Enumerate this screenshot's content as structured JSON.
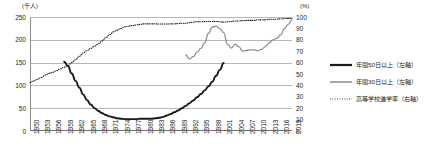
{
  "axes": {
    "left_unit": "(千人)",
    "right_unit": "(%)",
    "left_ticks": [
      "250",
      "200",
      "150",
      "100",
      "50",
      "0"
    ],
    "right_ticks": [
      "100",
      "90",
      "80",
      "70",
      "60",
      "50",
      "40",
      "30",
      "20",
      "10",
      "0"
    ],
    "x_ticks": [
      "1950",
      "1953",
      "1956",
      "1959",
      "1962",
      "1965",
      "1968",
      "1971",
      "1974",
      "1977",
      "1980",
      "1983",
      "1986",
      "1989",
      "1992",
      "1995",
      "1998",
      "2001",
      "2004",
      "2007",
      "2010",
      "2013",
      "2016",
      "2019"
    ]
  },
  "legend": {
    "items": [
      {
        "label": "年間50日以上（左軸）",
        "style": "thick-solid-black",
        "color": "#1a1a1a"
      },
      {
        "label": "年間30日以上（左軸）",
        "style": "solid-gray",
        "color": "#8c8c8c"
      },
      {
        "label": "高等学校進学率（右軸）",
        "style": "dotted-black",
        "color": "#1a1a1a"
      }
    ]
  },
  "chart_data": {
    "type": "line",
    "title": "",
    "xlabel": "",
    "ylabel": "千人",
    "y2label": "%",
    "ylim": [
      0,
      250
    ],
    "y2lim": [
      0,
      100
    ],
    "grid": true,
    "legend_position": "right",
    "x": [
      1950,
      1951,
      1952,
      1953,
      1954,
      1955,
      1956,
      1957,
      1958,
      1959,
      1960,
      1961,
      1962,
      1963,
      1964,
      1965,
      1966,
      1967,
      1968,
      1969,
      1970,
      1971,
      1972,
      1973,
      1974,
      1975,
      1976,
      1977,
      1978,
      1979,
      1980,
      1981,
      1982,
      1983,
      1984,
      1985,
      1986,
      1987,
      1988,
      1989,
      1990,
      1991,
      1992,
      1993,
      1994,
      1995,
      1996,
      1997,
      1998,
      1999,
      2000,
      2001,
      2002,
      2003,
      2004,
      2005,
      2006,
      2007,
      2008,
      2009,
      2010,
      2011,
      2012,
      2013,
      2014,
      2015,
      2016,
      2017,
      2018,
      2019
    ],
    "series": [
      {
        "name": "年間50日以上（左軸）",
        "axis": "left",
        "unit": "千人",
        "color": "#1a1a1a",
        "style": "thick-solid",
        "x_start": 1959,
        "x_end": 1998,
        "values": [
          null,
          null,
          null,
          null,
          null,
          null,
          null,
          null,
          null,
          152,
          142,
          126,
          110,
          95,
          80,
          68,
          58,
          50,
          44,
          39,
          35,
          32,
          30,
          28,
          27,
          26,
          26,
          26,
          26,
          27,
          27,
          27,
          27,
          28,
          29,
          31,
          34,
          37,
          41,
          45,
          50,
          55,
          61,
          67,
          74,
          81,
          89,
          98,
          108,
          121,
          134,
          149,
          null,
          null,
          null,
          null,
          null,
          null,
          null,
          null,
          null,
          null,
          null,
          null,
          null,
          null,
          null,
          null,
          null,
          null
        ]
      },
      {
        "name": "年間30日以上（左軸）",
        "axis": "left",
        "unit": "千人",
        "color": "#8c8c8c",
        "style": "solid",
        "x_start": 1991,
        "x_end": 2019,
        "values": [
          null,
          null,
          null,
          null,
          null,
          null,
          null,
          null,
          null,
          null,
          null,
          null,
          null,
          null,
          null,
          null,
          null,
          null,
          null,
          null,
          null,
          null,
          null,
          null,
          null,
          null,
          null,
          null,
          null,
          null,
          null,
          null,
          null,
          null,
          null,
          null,
          null,
          null,
          null,
          null,
          null,
          167,
          158,
          163,
          173,
          181,
          194,
          214,
          228,
          230,
          224,
          216,
          190,
          182,
          190,
          185,
          175,
          177,
          178,
          178,
          176,
          179,
          185,
          193,
          200,
          203,
          211,
          224,
          234,
          244
        ]
      },
      {
        "name": "高等学校進学率（右軸）",
        "axis": "right",
        "unit": "%",
        "color": "#1a1a1a",
        "style": "dotted",
        "x_start": 1950,
        "x_end": 2019,
        "values": [
          42.5,
          44.0,
          45.5,
          47.0,
          49.0,
          50.5,
          51.5,
          53.0,
          54.5,
          56.0,
          57.5,
          60.0,
          62.5,
          65.5,
          68.5,
          70.5,
          72.5,
          74.5,
          76.5,
          79.0,
          82.0,
          84.5,
          87.0,
          88.5,
          90.0,
          91.5,
          92.0,
          92.5,
          93.0,
          93.5,
          94.0,
          94.0,
          94.0,
          94.0,
          93.8,
          93.8,
          93.8,
          94.0,
          94.0,
          94.2,
          94.5,
          94.5,
          95.0,
          95.5,
          96.0,
          95.8,
          96.0,
          96.0,
          96.0,
          96.2,
          95.8,
          95.5,
          95.8,
          96.0,
          96.5,
          96.5,
          96.8,
          97.0,
          97.0,
          97.0,
          97.5,
          97.5,
          97.5,
          98.0,
          98.0,
          98.0,
          98.5,
          98.5,
          98.8,
          98.8
        ]
      }
    ]
  }
}
